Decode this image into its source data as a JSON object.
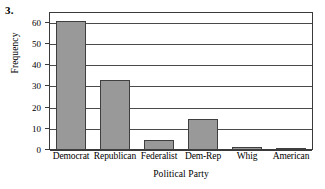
{
  "problem": {
    "number": "3."
  },
  "chart_data": {
    "type": "bar",
    "title": "",
    "xlabel": "Political Party",
    "ylabel": "Frequency",
    "categories": [
      "Democrat",
      "Republican",
      "Federalist",
      "Dem-Rep",
      "Whig",
      "American"
    ],
    "values": [
      61,
      33,
      4.5,
      14.5,
      1.5,
      0.5
    ],
    "ylim": [
      0,
      65
    ],
    "yticks": [
      0,
      10,
      20,
      30,
      40,
      50,
      60
    ],
    "ytick_labels": [
      "0",
      "10",
      "20",
      "30",
      "40",
      "50",
      "60"
    ],
    "grid": true,
    "legend": false,
    "bar_color": "#999999",
    "bar_edge_color": "#3f3f3f",
    "axis_color": "#3a3a3a"
  }
}
